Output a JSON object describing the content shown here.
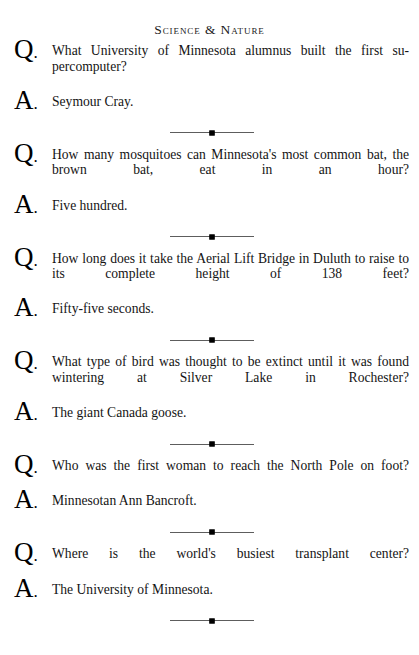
{
  "page": {
    "header": "Science & Nature",
    "background_color": "#ffffff",
    "text_color": "#141414",
    "rule_color": "#5d5d5d"
  },
  "ornament": {
    "name": "diamond-rule",
    "glyph": "diamond"
  },
  "markers": {
    "question": "Q",
    "answer": "A",
    "period": "."
  },
  "entries": [
    {
      "question": "What University of Minnesota alumnus built the first su-percomputer?",
      "answer": "Seymour Cray."
    },
    {
      "question": "How many mosquitoes can Minnesota's most common bat, the brown bat, eat in an hour?",
      "answer": "Five hundred."
    },
    {
      "question": "How long does it take the Aerial Lift Bridge in Duluth to raise to its complete height of 138 feet?",
      "answer": "Fifty-five seconds."
    },
    {
      "question": "What type of bird was thought to be extinct until it was found wintering at Silver Lake in Rochester?",
      "answer": "The giant Canada goose."
    },
    {
      "question": "Who was the first woman to reach the North Pole on foot?",
      "answer": "Minnesotan Ann Bancroft."
    },
    {
      "question": "Where is the world's busiest transplant center?",
      "answer": "The University of Minnesota."
    }
  ]
}
